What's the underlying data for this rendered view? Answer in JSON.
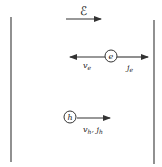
{
  "diagram": {
    "field": {
      "label": "ℰ",
      "direction": "right"
    },
    "electron": {
      "symbol": "e",
      "velocity_label": "v",
      "velocity_sub": "e",
      "current_label": "j",
      "current_sub": "e"
    },
    "hole": {
      "symbol": "h",
      "label": "v",
      "label_sub": "h",
      "sep": ", ",
      "label2": "j",
      "label2_sub": "h"
    },
    "colors": {
      "stroke": "#333333",
      "background": "#ffffff"
    }
  }
}
